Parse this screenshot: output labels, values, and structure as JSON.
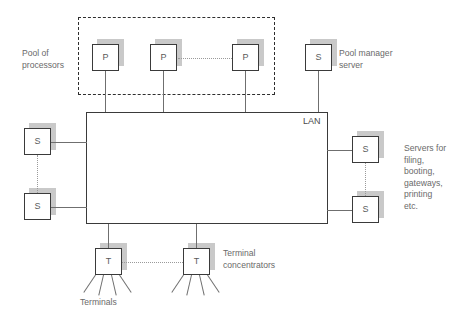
{
  "diagram": {
    "colors": {
      "background": "#ffffff",
      "node_border": "#3a3a3a",
      "node_shadow": "#c9c9c9",
      "connector": "#6f6f6f",
      "dotted": "#9a9a9a",
      "text": "#6a6a6a",
      "pool_border": "#2e2e2e"
    },
    "lan": {
      "label": "LAN"
    },
    "pool": {
      "caption": "Pool of\nprocessors",
      "nodes": [
        {
          "label": "P",
          "name": "processor-1"
        },
        {
          "label": "P",
          "name": "processor-2"
        },
        {
          "label": "P",
          "name": "processor-3"
        }
      ]
    },
    "pool_manager": {
      "node_label": "S",
      "caption": "Pool manager\nserver"
    },
    "left_servers": {
      "nodes": [
        {
          "label": "S",
          "name": "left-server-1"
        },
        {
          "label": "S",
          "name": "left-server-2"
        }
      ]
    },
    "right_servers": {
      "caption": "Servers for\nfiling,\nbooting,\ngateways,\nprinting\netc.",
      "nodes": [
        {
          "label": "S",
          "name": "right-server-1"
        },
        {
          "label": "S",
          "name": "right-server-2"
        }
      ]
    },
    "terminals": {
      "caption": "Terminal\nconcentrators",
      "terminals_caption": "Terminals",
      "nodes": [
        {
          "label": "T",
          "name": "terminal-concentrator-1"
        },
        {
          "label": "T",
          "name": "terminal-concentrator-2"
        }
      ]
    }
  }
}
